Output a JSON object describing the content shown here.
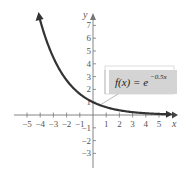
{
  "chart_data": {
    "type": "line",
    "title": "",
    "xlabel": "x",
    "ylabel": "y",
    "xlim": [
      -5.5,
      5.8
    ],
    "ylim": [
      -3.8,
      7.8
    ],
    "grid": false,
    "x_ticks": [
      -5,
      -4,
      -3,
      -2,
      -1,
      1,
      2,
      3,
      4,
      5
    ],
    "y_ticks": [
      -3,
      -2,
      -1,
      1,
      2,
      3,
      4,
      5,
      6,
      7
    ],
    "x_tick_labels": [
      "−5",
      "−4",
      "−3",
      "−2",
      "−1",
      "1",
      "2",
      "3",
      "4",
      "5"
    ],
    "y_tick_labels": [
      "−3",
      "−2",
      "−1",
      "1",
      "2",
      "3",
      "4",
      "5",
      "6",
      "7"
    ],
    "series": [
      {
        "name": "f(x) = e^(−0.5x)",
        "function": "exp(-0.5*x)",
        "x": [
          -4,
          -3,
          -2,
          -1,
          0,
          1,
          2,
          3,
          4,
          5,
          6
        ],
        "y": [
          7.39,
          4.48,
          2.72,
          1.65,
          1.0,
          0.61,
          0.37,
          0.22,
          0.14,
          0.08,
          0.05
        ],
        "color": "#333333"
      }
    ],
    "annotations": [
      {
        "text": "f(x) = e^(−0.5x)",
        "label_main": "f(x) = e",
        "label_exp": "−0.5x",
        "points_to_x": 0.6,
        "box_color": "#d4d4d4"
      }
    ],
    "colors": {
      "curve": "#333333",
      "axis": "#777777",
      "label_box": "#d4d4d4",
      "text": "#555555"
    }
  }
}
